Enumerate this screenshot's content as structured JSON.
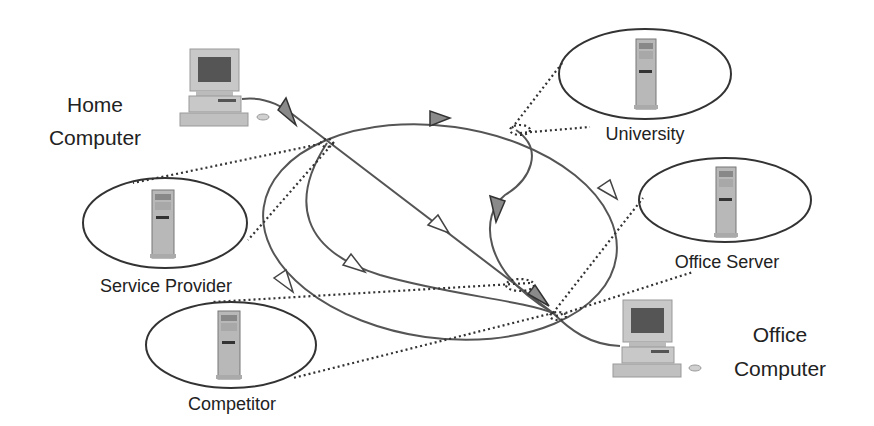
{
  "diagram": {
    "title": "",
    "nodes": {
      "home_computer": {
        "label_line1": "Home",
        "label_line2": "Computer",
        "icon": "desktop-computer-icon"
      },
      "service_provider": {
        "label": "Service Provider",
        "icon": "server-tower-icon"
      },
      "competitor": {
        "label": "Competitor",
        "icon": "server-tower-icon"
      },
      "university": {
        "label": "University",
        "icon": "server-tower-icon"
      },
      "office_server": {
        "label": "Office Server",
        "icon": "server-tower-icon"
      },
      "office_computer": {
        "label_line1": "Office",
        "label_line2": "Computer",
        "icon": "desktop-computer-icon"
      }
    },
    "edges": [
      {
        "from": "home_computer",
        "to": "office_computer",
        "style": "solid",
        "note": "direct diagonal route through network"
      },
      {
        "from": "service_provider",
        "to": "university",
        "style": "solid",
        "note": "upper arc of network ellipse"
      },
      {
        "from": "university",
        "to": "office_server",
        "style": "solid"
      },
      {
        "from": "university",
        "to": "office_computer",
        "style": "solid",
        "note": "inner curve"
      },
      {
        "from": "service_provider",
        "to": "office_computer",
        "style": "solid",
        "note": "inner lower arc"
      },
      {
        "from": "service_provider",
        "to": "competitor",
        "style": "solid",
        "note": "outer lower arc"
      }
    ],
    "taps": [
      {
        "hub": "home_hub",
        "to": "service_provider",
        "style": "dotted"
      },
      {
        "hub": "university_hub",
        "to": "university",
        "style": "dotted"
      },
      {
        "hub": "office_hub",
        "to": "office_server",
        "style": "dotted"
      },
      {
        "hub": "office_hub",
        "to": "competitor",
        "style": "dotted"
      }
    ],
    "colors": {
      "line": "#555555",
      "arrow_filled": "#8a8a8a",
      "arrow_open": "#ffffff",
      "device_body": "#c8c8c8",
      "screen": "#555555",
      "text": "#222222"
    }
  }
}
